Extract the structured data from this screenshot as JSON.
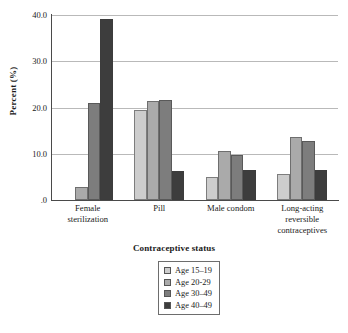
{
  "chart_data": {
    "type": "bar",
    "title": "",
    "xlabel": "Contraceptive status",
    "ylabel": "Percent (%)",
    "categories": [
      "Female\nsterilization",
      "Pill",
      "Male condom",
      "Long-acting\nreversible\ncontraceptives"
    ],
    "category_lines": [
      [
        "Female",
        "sterilization"
      ],
      [
        "Pill"
      ],
      [
        "Male condom"
      ],
      [
        "Long-acting",
        "reversible",
        "contraceptives"
      ]
    ],
    "series": [
      {
        "name": "Age 15–19",
        "color": "#cdcdcd",
        "values": [
          0.0,
          19.5,
          4.9,
          5.7
        ]
      },
      {
        "name": "Age 20-29",
        "color": "#aaaaaa",
        "values": [
          2.8,
          21.5,
          10.6,
          13.6
        ]
      },
      {
        "name": "Age 30–49",
        "color": "#7d7d7d",
        "values": [
          21.0,
          21.6,
          9.8,
          12.7
        ]
      },
      {
        "name": "Age 40–49",
        "color": "#3d3d3d",
        "values": [
          39.2,
          6.3,
          6.4,
          6.4
        ]
      }
    ],
    "ylim": [
      0,
      40
    ],
    "yticks": [
      0,
      10,
      20,
      30,
      40
    ],
    "ytick_labels": [
      ".0",
      "10.0",
      "20.0",
      "30.0",
      "40.0"
    ],
    "grid": true,
    "legend_position": "bottom-center"
  },
  "legend": {
    "entries": [
      {
        "label": "Age 15–19"
      },
      {
        "label": "Age 20-29"
      },
      {
        "label": "Age 30–49"
      },
      {
        "label": "Age 40–49"
      }
    ]
  }
}
